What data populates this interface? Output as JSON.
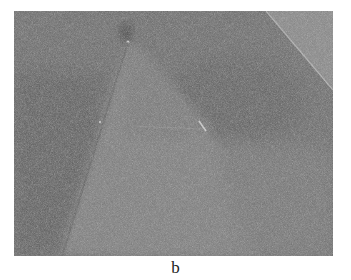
{
  "figure": {
    "panel_label": "b",
    "image": {
      "description": "grayscale electron micrograph with triangular lighter region and diagonal boundary at top-right",
      "colors": {
        "background": "#6a6a6a",
        "triangle_region": "#7a7a7a",
        "corner_region": "#858585",
        "dark_band": "#595959",
        "highlight": "#c8c8c8"
      }
    }
  }
}
